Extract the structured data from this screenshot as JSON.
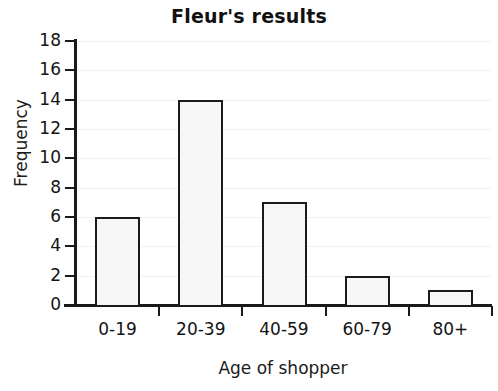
{
  "chart_data": {
    "type": "bar",
    "title": "Fleur's results",
    "xlabel": "Age of shopper",
    "ylabel": "Frequency",
    "categories": [
      "0-19",
      "20-39",
      "40-59",
      "60-79",
      "80+"
    ],
    "values": [
      6,
      14,
      7,
      2,
      1
    ],
    "ylim": [
      0,
      18
    ],
    "ytick_values": [
      0,
      2,
      4,
      6,
      8,
      10,
      12,
      14,
      16,
      18
    ],
    "ytick_labels": [
      "0",
      "2",
      "4",
      "6",
      "8",
      "10",
      "12",
      "14",
      "16",
      "18"
    ],
    "grid": "horizontal-faint",
    "legend": "none",
    "bar_fill_color": "#f7f7f7",
    "bar_edge_color": "#1a1a1a",
    "axis_color": "#1a1a1a",
    "gridline_color": "#f1f1f1",
    "background_color": "#ffffff"
  }
}
